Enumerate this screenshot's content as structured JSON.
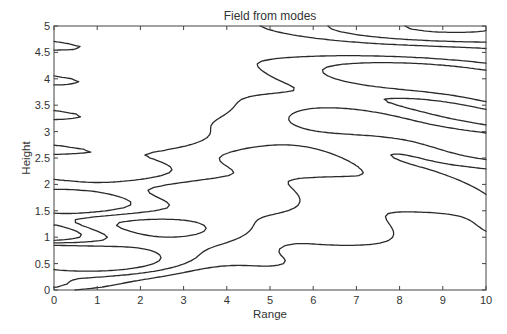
{
  "chart_data": {
    "type": "contour",
    "title": "Field from modes",
    "xlabel": "Range",
    "ylabel": "Height",
    "xlim": [
      0,
      10
    ],
    "ylim": [
      0,
      5
    ],
    "xticks": [
      0,
      1,
      2,
      3,
      4,
      5,
      6,
      7,
      8,
      9,
      10
    ],
    "xtick_labels": [
      "0",
      "1",
      "2",
      "3",
      "4",
      "5",
      "6",
      "7",
      "8",
      "9",
      "10"
    ],
    "yticks": [
      0,
      0.5,
      1,
      1.5,
      2,
      2.5,
      3,
      3.5,
      4,
      4.5,
      5
    ],
    "ytick_labels": [
      "0",
      "0.5",
      "1",
      "1.5",
      "2",
      "2.5",
      "3",
      "3.5",
      "4",
      "4.5",
      "5"
    ],
    "grid": false,
    "legend": null,
    "line_color": "#2a2a2a"
  },
  "layout": {
    "plot_left": 54,
    "plot_top": 26,
    "plot_right": 486,
    "plot_bottom": 290
  }
}
